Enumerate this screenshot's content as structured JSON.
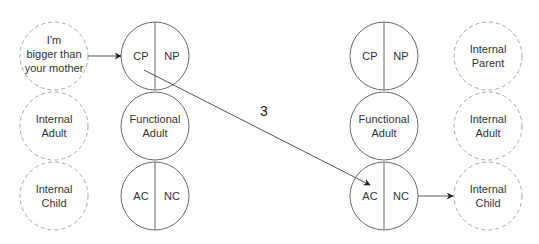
{
  "colors": {
    "solid_stroke": "#6a6a6a",
    "dashed_stroke": "#a8a8a8",
    "arrow": "#333333",
    "text": "#333333"
  },
  "left_internal": {
    "parent": [
      "I'm",
      "bigger than",
      "your mother"
    ],
    "adult": [
      "Internal",
      "Adult"
    ],
    "child": [
      "Internal",
      "Child"
    ]
  },
  "left_functional": {
    "parent": {
      "left": "CP",
      "right": "NP"
    },
    "adult": [
      "Functional",
      "Adult"
    ],
    "child": {
      "left": "AC",
      "right": "NC"
    }
  },
  "right_functional": {
    "parent": {
      "left": "CP",
      "right": "NP"
    },
    "adult": [
      "Functional",
      "Adult"
    ],
    "child": {
      "left": "AC",
      "right": "NC"
    }
  },
  "right_internal": {
    "parent": [
      "Internal",
      "Parent"
    ],
    "adult": [
      "Internal",
      "Adult"
    ],
    "child": [
      "Internal",
      "Child"
    ]
  },
  "transaction": {
    "label": "3",
    "from": "left CP",
    "to": "right AC"
  }
}
